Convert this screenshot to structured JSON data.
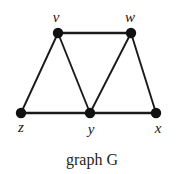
{
  "figure": {
    "caption": "graph G",
    "background_color": "#ffffff",
    "ink_color": "#1a1a1a"
  },
  "chart_data": {
    "type": "diagram",
    "subtype": "undirected-graph",
    "title": "graph G",
    "vertices": [
      {
        "id": "v",
        "label": "v",
        "cx": 58,
        "cy": 33,
        "r": 5.2,
        "label_x": 56,
        "label_y": 22
      },
      {
        "id": "w",
        "label": "w",
        "cx": 131,
        "cy": 33,
        "r": 5.2,
        "label_x": 130,
        "label_y": 22
      },
      {
        "id": "z",
        "label": "z",
        "cx": 21,
        "cy": 113,
        "r": 5.2,
        "label_x": 21,
        "label_y": 132
      },
      {
        "id": "y",
        "label": "y",
        "cx": 90,
        "cy": 113,
        "r": 5.2,
        "label_x": 91,
        "label_y": 134
      },
      {
        "id": "x",
        "label": "x",
        "cx": 156,
        "cy": 113,
        "r": 5.2,
        "label_x": 158,
        "label_y": 133
      }
    ],
    "edges": [
      {
        "id": "v-w",
        "from": "v",
        "to": "w",
        "width": 2.6
      },
      {
        "id": "v-z",
        "from": "v",
        "to": "z",
        "width": 1.9
      },
      {
        "id": "v-y",
        "from": "v",
        "to": "y",
        "width": 1.9
      },
      {
        "id": "w-y",
        "from": "w",
        "to": "y",
        "width": 1.9
      },
      {
        "id": "w-x",
        "from": "w",
        "to": "x",
        "width": 1.9
      },
      {
        "id": "z-y",
        "from": "z",
        "to": "y",
        "width": 2.6
      },
      {
        "id": "y-x",
        "from": "y",
        "to": "x",
        "width": 2.6
      }
    ],
    "vertex_count": 5,
    "edge_count": 7,
    "caption_x": 92,
    "caption_y": 165
  }
}
